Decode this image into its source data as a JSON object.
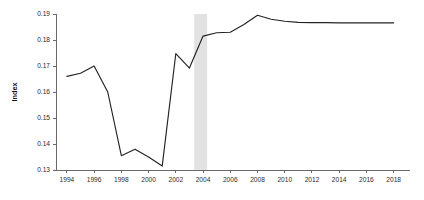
{
  "chart_data": {
    "type": "line",
    "title": "",
    "subtitle": "",
    "xlabel": "",
    "ylabel": "Index",
    "xlim": [
      1993.2,
      2019.2
    ],
    "ylim": [
      0.13,
      0.19
    ],
    "grid": false,
    "legend": null,
    "legend_position": "none",
    "x_ticks": [
      1994,
      1996,
      1998,
      2000,
      2002,
      2004,
      2006,
      2008,
      2010,
      2012,
      2014,
      2016,
      2018
    ],
    "x_tick_labels": [
      "1994",
      "1996",
      "1998",
      "2000",
      "2002",
      "2004",
      "2006",
      "2008",
      "2010",
      "2012",
      "2014",
      "2016",
      "2018"
    ],
    "y_ticks": [
      0.13,
      0.14,
      0.15,
      0.16,
      0.17,
      0.18,
      0.19
    ],
    "y_tick_labels": [
      "0.13",
      "0.14",
      "0.15",
      "0.16",
      "0.17",
      "0.18",
      "0.19"
    ],
    "series": [
      {
        "name": "Index",
        "color": "#232323",
        "x": [
          1994,
          1995,
          1996,
          1997,
          1998,
          1999,
          2000,
          2001,
          2002,
          2003,
          2004,
          2005,
          2006,
          2007,
          2008,
          2009,
          2010,
          2011,
          2012,
          2013,
          2014,
          2015,
          2016,
          2017,
          2018
        ],
        "values": [
          0.166,
          0.1672,
          0.17,
          0.16,
          0.1355,
          0.138,
          0.135,
          0.1315,
          0.1748,
          0.1692,
          0.1815,
          0.1828,
          0.183,
          0.186,
          0.1895,
          0.188,
          0.1872,
          0.1868,
          0.1867,
          0.1867,
          0.1866,
          0.1866,
          0.1866,
          0.1866,
          0.1866
        ]
      }
    ],
    "annotations": [
      {
        "type": "vertical-band",
        "name": "recession-band",
        "x_start": 2003.35,
        "x_end": 2004.3,
        "color": "#e2e2e2"
      }
    ]
  }
}
